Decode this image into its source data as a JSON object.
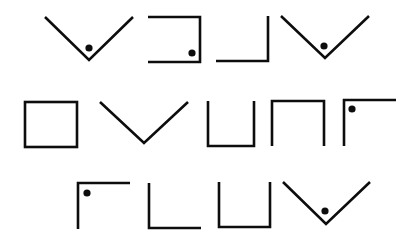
{
  "puzzle": {
    "type": "pigpen-cipher",
    "stroke_color": "#0d0d0d",
    "background": "#ffffff",
    "rows": [
      {
        "glyphs": [
          {
            "shape": "v",
            "dot": true
          },
          {
            "shape": "box-open-left",
            "dot": true
          },
          {
            "shape": "corner-bottom-right",
            "dot": false
          },
          {
            "shape": "v",
            "dot": true
          }
        ]
      },
      {
        "glyphs": [
          {
            "shape": "box",
            "dot": false
          },
          {
            "shape": "v",
            "dot": false
          },
          {
            "shape": "u",
            "dot": false
          },
          {
            "shape": "n",
            "dot": false
          },
          {
            "shape": "corner-top-left",
            "dot": true
          }
        ]
      },
      {
        "glyphs": [
          {
            "shape": "corner-top-left",
            "dot": true
          },
          {
            "shape": "corner-bottom-left",
            "dot": false
          },
          {
            "shape": "u",
            "dot": false
          },
          {
            "shape": "v",
            "dot": true
          }
        ]
      }
    ]
  }
}
